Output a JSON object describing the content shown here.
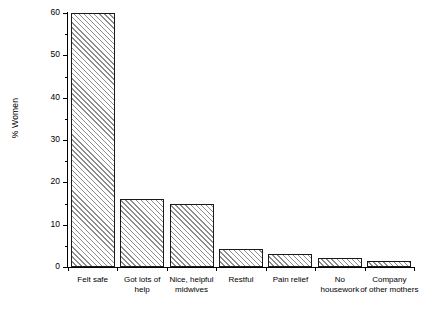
{
  "chart_data": {
    "type": "bar",
    "title": "",
    "subtitle": "",
    "xlabel": "",
    "ylabel": "% Women",
    "ylim": [
      0,
      60
    ],
    "ytick_values": [
      0,
      10,
      20,
      30,
      40,
      50,
      60
    ],
    "ytick_labels": [
      "0",
      "10",
      "20",
      "30",
      "40",
      "50",
      "60"
    ],
    "yminor_tick_values": [
      5,
      15,
      25,
      35,
      45,
      55
    ],
    "grid": false,
    "legend": null,
    "categories": [
      "Felt safe",
      "Got lots of\nhelp",
      "Nice, helpful\nmidwives",
      "Restful",
      "Pain relief",
      "No\nhousework",
      "Company\nof other mothers"
    ],
    "values": [
      60,
      16,
      15,
      4.3,
      3,
      2.2,
      1.4
    ],
    "bar_style": {
      "fill": "#ffffff",
      "hatch": "diagonal-45",
      "hatch_color": "#8d8d8d",
      "edge_color": "#1a1a1a"
    },
    "background_color": "#ffffff",
    "axis_color": "#000000"
  }
}
